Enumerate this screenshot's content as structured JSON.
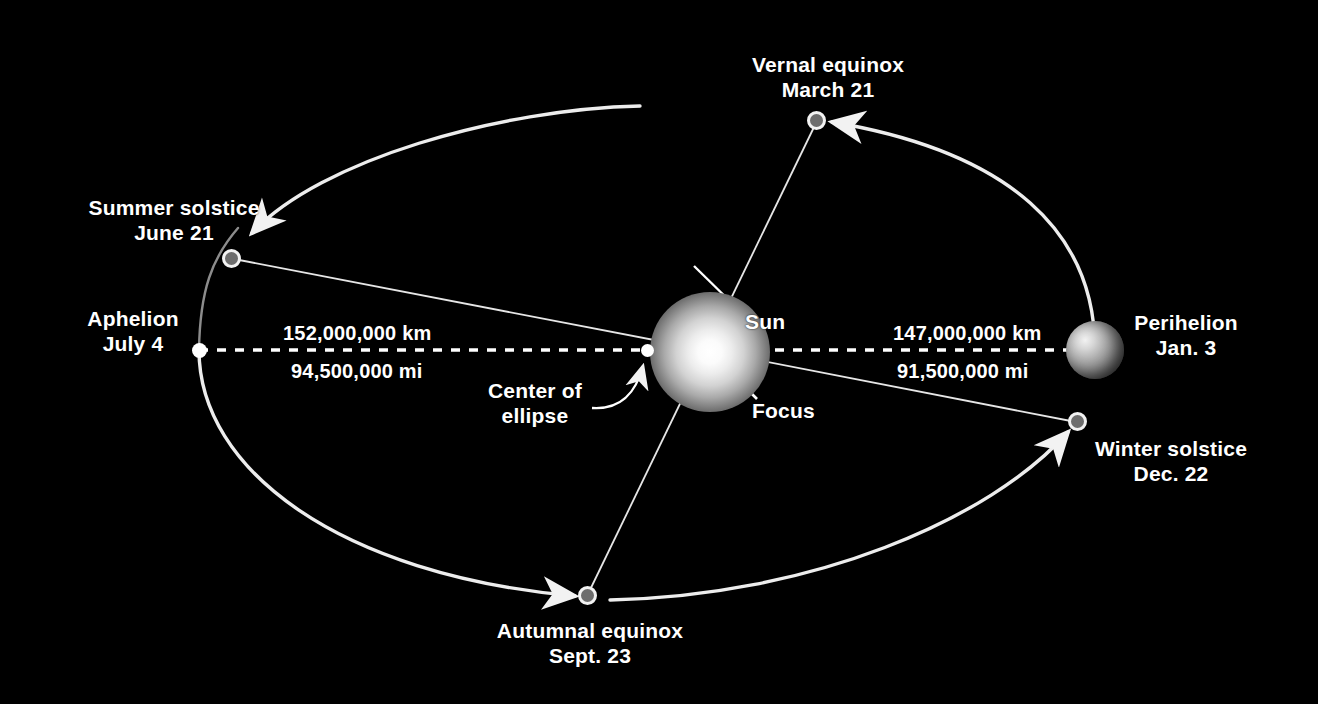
{
  "diagram": {
    "background_color": "#000000",
    "text_color": "#ffffff",
    "orbit_line_color": "#f0f0f0"
  },
  "sun": {
    "label": "Sun",
    "focus_label": "Focus"
  },
  "center": {
    "line1": "Center of",
    "line2": "ellipse"
  },
  "axis": {
    "left": {
      "km": "152,000,000 km",
      "mi": "94,500,000 mi"
    },
    "right": {
      "km": "147,000,000 km",
      "mi": "91,500,000 mi"
    }
  },
  "points": [
    {
      "id": "vernal-equinox",
      "name": "Vernal equinox",
      "date": "March 21"
    },
    {
      "id": "summer-solstice",
      "name": "Summer solstice",
      "date": "June 21"
    },
    {
      "id": "aphelion",
      "name": "Aphelion",
      "date": "July 4"
    },
    {
      "id": "autumnal-equinox",
      "name": "Autumnal equinox",
      "date": "Sept. 23"
    },
    {
      "id": "winter-solstice",
      "name": "Winter solstice",
      "date": "Dec. 22"
    },
    {
      "id": "perihelion",
      "name": "Perihelion",
      "date": "Jan. 3"
    }
  ]
}
